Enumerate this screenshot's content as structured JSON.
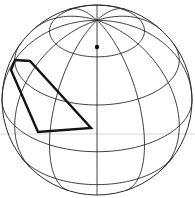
{
  "diagram": {
    "type": "orthographic-globe",
    "canvas": {
      "width": 195,
      "height": 198
    },
    "globe": {
      "cx": 97,
      "cy": 100,
      "r": 95,
      "tilt_deg": 33,
      "rotation_deg": 0
    },
    "graticule": {
      "latitudes_deg": [
        -60,
        -30,
        0,
        30,
        60
      ],
      "longitudes_deg": [
        0,
        30,
        60,
        90,
        120,
        150,
        180,
        210,
        240,
        270,
        300,
        330
      ]
    },
    "pole_marker": {
      "x": 97,
      "y": 47,
      "r": 2.2
    },
    "highlight_polygon": {
      "points": [
        [
          15,
          60
        ],
        [
          30,
          61
        ],
        [
          91,
          128
        ],
        [
          38,
          132
        ],
        [
          11,
          70
        ]
      ],
      "color": "#141414"
    },
    "guide_line": {
      "y": 134,
      "x1": 0,
      "x2": 195,
      "color": "#d8d8d8"
    },
    "colors": {
      "line": "#2a2a2a",
      "background": "#ffffff"
    }
  }
}
